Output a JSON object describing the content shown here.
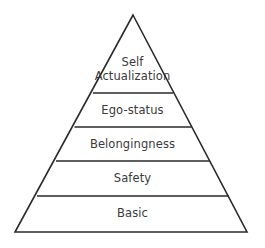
{
  "diagram": {
    "type": "pyramid",
    "background_color": "#ffffff",
    "line_color": "#2a2a2a",
    "text_color": "#3a3a3a",
    "apex": {
      "x": 133,
      "y": 15
    },
    "base_left": {
      "x": 15,
      "y": 232
    },
    "base_right": {
      "x": 247,
      "y": 232
    },
    "divider_y": [
      93,
      127,
      161,
      196
    ],
    "tiers": [
      {
        "name": "self-actualization",
        "label_lines": [
          "Self",
          "Actualization"
        ],
        "label": "Self Actualization",
        "order": 1,
        "top_y": 15,
        "bottom_y": 93
      },
      {
        "name": "ego-status",
        "label_lines": [
          "Ego-status"
        ],
        "label": "Ego-status",
        "order": 2,
        "top_y": 93,
        "bottom_y": 127
      },
      {
        "name": "belongingness",
        "label_lines": [
          "Belongingness"
        ],
        "label": "Belongingness",
        "order": 3,
        "top_y": 127,
        "bottom_y": 161
      },
      {
        "name": "safety",
        "label_lines": [
          "Safety"
        ],
        "label": "Safety",
        "order": 4,
        "top_y": 161,
        "bottom_y": 196
      },
      {
        "name": "basic",
        "label_lines": [
          "Basic"
        ],
        "label": "Basic",
        "order": 5,
        "top_y": 196,
        "bottom_y": 232
      }
    ]
  }
}
